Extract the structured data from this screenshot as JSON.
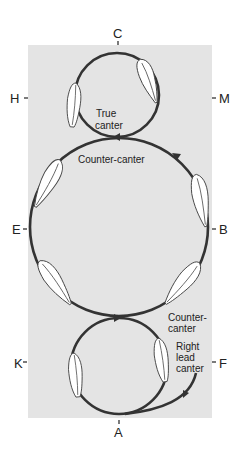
{
  "diagram": {
    "type": "dressage-arena-canter-figure",
    "arena_color": "#e4e4e4",
    "track_color": "#333333",
    "markers": {
      "top": "C",
      "bottom": "A",
      "upper_left": "H",
      "upper_right": "M",
      "middle_left": "E",
      "middle_right": "B",
      "lower_left": "K",
      "lower_right": "F"
    },
    "annotations": {
      "top_circle": [
        "True",
        "canter"
      ],
      "middle_circle": "Counter-canter",
      "lower_right_counter": [
        "Counter-",
        "canter"
      ],
      "bottom_circle": [
        "Right",
        "lead",
        "canter"
      ]
    },
    "circles": [
      {
        "name": "top-circle",
        "label": "True canter",
        "size": "small"
      },
      {
        "name": "middle-circle",
        "label": "Counter-canter",
        "size": "large"
      },
      {
        "name": "bottom-circle",
        "label": "Right lead canter",
        "size": "small"
      }
    ]
  }
}
